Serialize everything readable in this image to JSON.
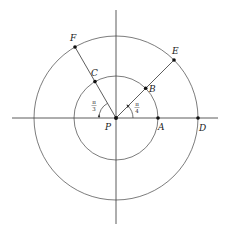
{
  "diagram": {
    "center": {
      "label": "P",
      "x": 116,
      "y": 118
    },
    "inner_radius": 42,
    "outer_radius": 82,
    "stroke_color": "#333333",
    "points": [
      {
        "label": "A",
        "angle_deg": 0,
        "circle": "inner"
      },
      {
        "label": "B",
        "angle_deg": 45,
        "circle": "inner"
      },
      {
        "label": "C",
        "angle_deg": 120,
        "circle": "inner"
      },
      {
        "label": "D",
        "angle_deg": 0,
        "circle": "outer"
      },
      {
        "label": "E",
        "angle_deg": 45,
        "circle": "outer"
      },
      {
        "label": "F",
        "angle_deg": 120,
        "circle": "outer"
      }
    ],
    "angle_labels": {
      "right": {
        "numerator": "π",
        "denominator": "4"
      },
      "left": {
        "numerator": "π",
        "denominator": "3"
      }
    }
  }
}
